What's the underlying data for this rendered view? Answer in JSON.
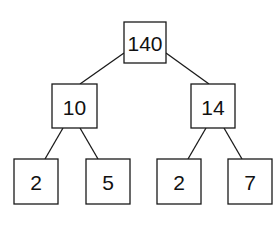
{
  "diagram": {
    "type": "tree",
    "colors": {
      "background": "#ffffff",
      "stroke": "#1a1a1a",
      "text": "#111111"
    },
    "nodes": [
      {
        "id": "root",
        "label": "140",
        "x": 124,
        "y": 22,
        "w": 42,
        "h": 41
      },
      {
        "id": "left",
        "label": "10",
        "x": 52,
        "y": 84,
        "w": 45,
        "h": 44
      },
      {
        "id": "right",
        "label": "14",
        "x": 191,
        "y": 84,
        "w": 44,
        "h": 44
      },
      {
        "id": "left-left",
        "label": "2",
        "x": 14,
        "y": 159,
        "w": 44,
        "h": 45
      },
      {
        "id": "left-right",
        "label": "5",
        "x": 86,
        "y": 159,
        "w": 44,
        "h": 45
      },
      {
        "id": "right-left",
        "label": "2",
        "x": 157,
        "y": 159,
        "w": 44,
        "h": 45
      },
      {
        "id": "right-right",
        "label": "7",
        "x": 228,
        "y": 159,
        "w": 44,
        "h": 45
      }
    ],
    "edges": [
      {
        "from": "root",
        "to": "left",
        "x1": 124,
        "y1": 53,
        "x2": 80,
        "y2": 84
      },
      {
        "from": "root",
        "to": "right",
        "x1": 166,
        "y1": 53,
        "x2": 209,
        "y2": 84
      },
      {
        "from": "left",
        "to": "left-left",
        "x1": 63,
        "y1": 128,
        "x2": 45,
        "y2": 159
      },
      {
        "from": "left",
        "to": "left-right",
        "x1": 80,
        "y1": 128,
        "x2": 98,
        "y2": 159
      },
      {
        "from": "right",
        "to": "right-left",
        "x1": 206,
        "y1": 128,
        "x2": 188,
        "y2": 159
      },
      {
        "from": "right",
        "to": "right-right",
        "x1": 224,
        "y1": 128,
        "x2": 242,
        "y2": 159
      }
    ]
  }
}
